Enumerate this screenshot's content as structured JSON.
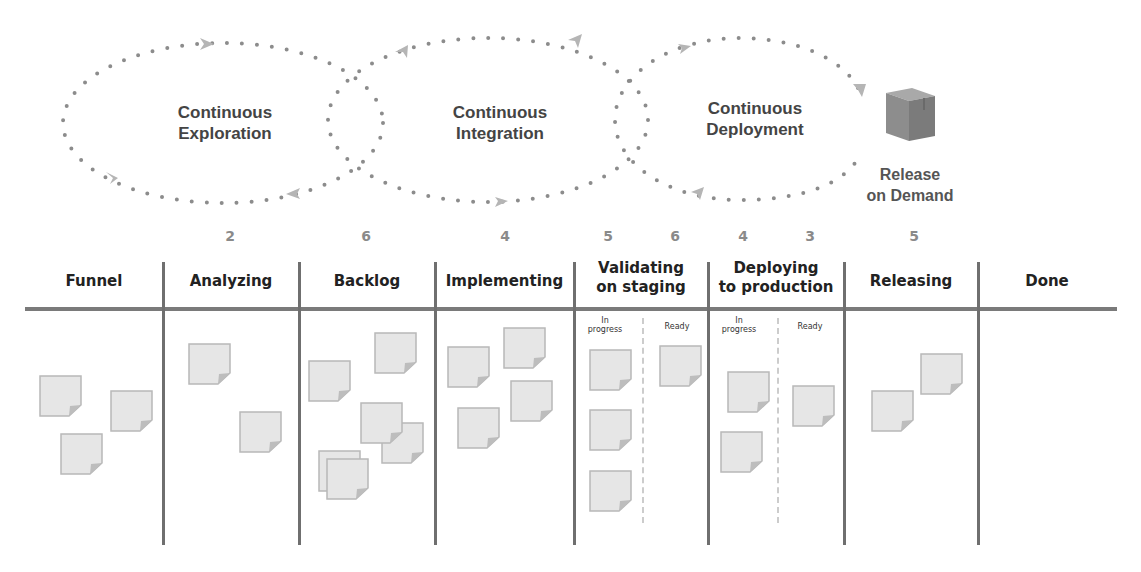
{
  "pipeline": {
    "loops": [
      {
        "id": "exploration",
        "label": "Continuous\nExploration"
      },
      {
        "id": "integration",
        "label": "Continuous\nIntegration"
      },
      {
        "id": "deployment",
        "label": "Continuous\nDeployment"
      }
    ],
    "release": {
      "icon": "package-cube-icon",
      "label": "Release\non Demand"
    }
  },
  "board": {
    "columns": [
      {
        "id": "funnel",
        "title": "Funnel",
        "wip": null,
        "notes": 3
      },
      {
        "id": "analyzing",
        "title": "Analyzing",
        "wip": "2",
        "notes": 2
      },
      {
        "id": "backlog",
        "title": "Backlog",
        "wip": "6",
        "notes": 6
      },
      {
        "id": "implementing",
        "title": "Implementing",
        "wip": "4",
        "notes": 4
      },
      {
        "id": "validating",
        "title": "Validating\non staging",
        "sub_columns": [
          {
            "title": "In\nprogress",
            "wip": "5",
            "notes": 3
          },
          {
            "title": "Ready",
            "wip": "6",
            "notes": 1
          }
        ]
      },
      {
        "id": "deploying",
        "title": "Deploying\nto production",
        "sub_columns": [
          {
            "title": "In\nprogress",
            "wip": "4",
            "notes": 2
          },
          {
            "title": "Ready",
            "wip": "3",
            "notes": 1
          }
        ]
      },
      {
        "id": "releasing",
        "title": "Releasing",
        "wip": "5",
        "notes": 2
      },
      {
        "id": "done",
        "title": "Done",
        "wip": null,
        "notes": 0
      }
    ]
  },
  "colors": {
    "dots": "#8c8c8c",
    "arrows": "#b5b5b5",
    "board_lines": "#707070",
    "note_fill": "#e6e6e6",
    "note_border": "#b8b8b8",
    "wip_count": "#8a8a8a"
  }
}
